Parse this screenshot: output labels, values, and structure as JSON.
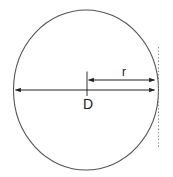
{
  "figure": {
    "name": "circle-diameter-radius-diagram",
    "background_color": "#ffffff",
    "stroke_color": "#555555",
    "arrow_color": "#222222",
    "text_color": "#1a1a1a",
    "dotted_line_color": "#999999"
  },
  "labels": {
    "diameter": "D",
    "radius": "r"
  },
  "geometry": {
    "circle": {
      "center_x": 86,
      "center_y": 90,
      "radius_x": 72,
      "radius_y": 80
    },
    "diameter_arrow": {
      "y": 90,
      "x_start": 14,
      "x_end": 156
    },
    "radius_arrow": {
      "y": 80,
      "x_start": 87,
      "x_end": 156
    },
    "center_tick": {
      "x": 87,
      "y_top": 72,
      "y_bottom": 96
    },
    "tangent_line": {
      "x": 158,
      "y_top": 47,
      "y_bottom": 149
    },
    "label_positions": {
      "diameter": {
        "x": 88,
        "y": 108
      },
      "radius": {
        "x": 124,
        "y": 76
      }
    }
  }
}
